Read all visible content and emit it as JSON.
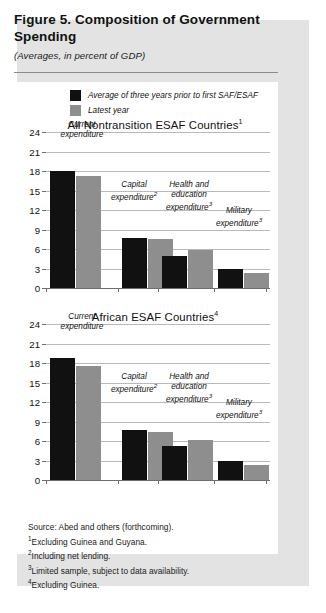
{
  "figure": {
    "title": "Figure 5.  Composition of Government Spending",
    "subtitle": "(Averages, in percent of GDP)"
  },
  "legend": {
    "items": [
      {
        "label": "Average of three years prior to first SAF/ESAF",
        "color": "#111111",
        "swatch": "dark-swatch"
      },
      {
        "label": "Latest year",
        "color": "#8e8e8e",
        "swatch": "gray-swatch"
      }
    ]
  },
  "notes": [
    {
      "marker": "",
      "text": "Source: Abed and others (forthcoming)."
    },
    {
      "marker": "1",
      "text": "Excluding Guinea and Guyana."
    },
    {
      "marker": "2",
      "text": "Including net lending."
    },
    {
      "marker": "3",
      "text": "Limited sample, subject to data availability."
    },
    {
      "marker": "4",
      "text": "Excluding Guinea."
    }
  ],
  "axis": {
    "yticks": [
      "0",
      "3",
      "6",
      "9",
      "12",
      "15",
      "18",
      "21",
      "24"
    ],
    "ymin": 0,
    "ymax": 24
  },
  "chart_data": [
    {
      "type": "bar",
      "title": "All Nontransition ESAF Countries",
      "title_note": "1",
      "categories": [
        "Current expenditure",
        "Capital expenditure",
        "Health and education expenditure",
        "Military expenditure"
      ],
      "category_notes": [
        "",
        "2",
        "3",
        "3"
      ],
      "series": [
        {
          "name": "Average of three years prior to first SAF/ESAF",
          "color": "#111111",
          "values": [
            18.0,
            7.7,
            4.9,
            2.9
          ]
        },
        {
          "name": "Latest year",
          "color": "#8e8e8e",
          "values": [
            17.3,
            7.5,
            5.8,
            2.3
          ]
        }
      ],
      "xlabel": "",
      "ylabel": "",
      "ylim": [
        0,
        24
      ],
      "yticks": [
        0,
        3,
        6,
        9,
        12,
        15,
        18,
        21,
        24
      ],
      "grid": true,
      "legend_position": "top"
    },
    {
      "type": "bar",
      "title": "African ESAF Countries",
      "title_note": "4",
      "categories": [
        "Current expenditure",
        "Capital expenditure",
        "Health and education expenditure",
        "Military expenditure"
      ],
      "category_notes": [
        "",
        "2",
        "3",
        "3"
      ],
      "series": [
        {
          "name": "Average of three years prior to first SAF/ESAF",
          "color": "#111111",
          "values": [
            18.7,
            7.7,
            5.3,
            3.0
          ]
        },
        {
          "name": "Latest year",
          "color": "#8e8e8e",
          "values": [
            17.5,
            7.4,
            6.2,
            2.3
          ]
        }
      ],
      "xlabel": "",
      "ylabel": "",
      "ylim": [
        0,
        24
      ],
      "yticks": [
        0,
        3,
        6,
        9,
        12,
        15,
        18,
        21,
        24
      ],
      "grid": true,
      "legend_position": "top"
    }
  ]
}
